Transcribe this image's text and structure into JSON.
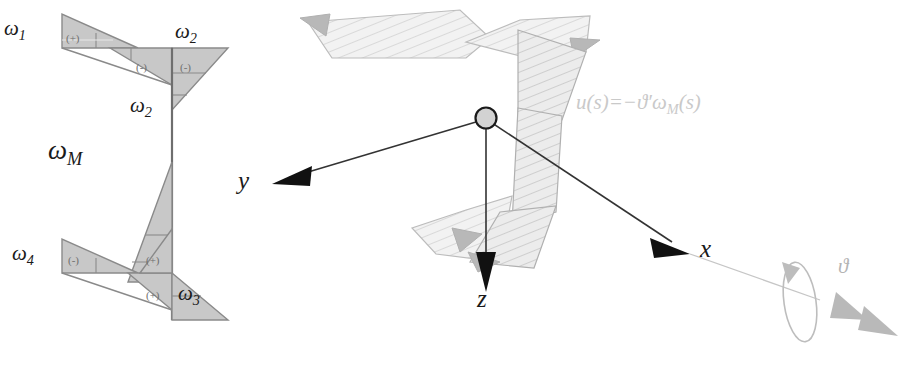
{
  "figure": {
    "background_color": "#ffffff"
  },
  "colors": {
    "triangle_fill": "#c8c8c8",
    "triangle_stroke": "#8a8a8a",
    "hatch_fill": "#ebebeb",
    "hatch_stroke": "#b0b0b0",
    "axis_line": "#333333",
    "axis_arrow": "#111111",
    "faint_text": "#c9c9c9",
    "theta_gray": "#b4b4b4",
    "label_text": "#1a1a1a"
  },
  "left_diagram": {
    "name": "warping-function-cross-section",
    "labels": {
      "omega1": {
        "base": "ω",
        "sub": "1"
      },
      "omega2_top": {
        "base": "ω",
        "sub": "2"
      },
      "omega2_mid": {
        "base": "ω",
        "sub": "2"
      },
      "omegaM": {
        "base": "ω",
        "sub": "M"
      },
      "omega4": {
        "base": "ω",
        "sub": "4"
      },
      "omega3": {
        "base": "ω",
        "sub": "3"
      }
    },
    "signs": [
      {
        "id": "sign-top-left",
        "text": "(+)"
      },
      {
        "id": "sign-top-mid",
        "text": "(-)"
      },
      {
        "id": "sign-top-right",
        "text": "(-)"
      },
      {
        "id": "sign-bottom-left",
        "text": "(-)"
      },
      {
        "id": "sign-bottom-mid",
        "text": "(+)"
      },
      {
        "id": "sign-bottom-right",
        "text": "(+)"
      }
    ]
  },
  "right_diagram": {
    "name": "twisted-beam-axes",
    "formula": {
      "lhs": "u(s)",
      "equals": "=",
      "rhs_sign": "−",
      "rhs_theta": "ϑ′",
      "rhs_omega": {
        "base": "ω",
        "sub": "M"
      },
      "rhs_arg": "(s)",
      "full": "u(s)=−ϑ′ωM(s)"
    },
    "axes": [
      {
        "id": "axis-y",
        "label": "y"
      },
      {
        "id": "axis-z",
        "label": "z"
      },
      {
        "id": "axis-x",
        "label": "x"
      }
    ],
    "rotation": {
      "label": "ϑ"
    },
    "origin": {
      "name": "origin-node"
    }
  }
}
